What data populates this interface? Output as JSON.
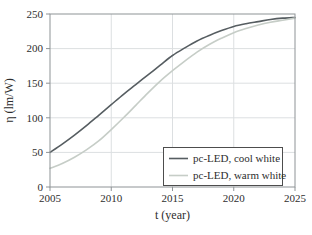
{
  "chart_data": {
    "type": "line",
    "title": "",
    "xlabel": "t (year)",
    "ylabel": "η (lm/W)",
    "xlim": [
      2005,
      2025
    ],
    "ylim": [
      0,
      250
    ],
    "x_ticks": [
      2005,
      2010,
      2015,
      2020,
      2025
    ],
    "y_ticks": [
      0,
      50,
      100,
      150,
      200,
      250
    ],
    "grid": true,
    "legend_position": "lower right",
    "x": [
      2005,
      2006,
      2007,
      2008,
      2009,
      2010,
      2011,
      2012,
      2013,
      2014,
      2015,
      2016,
      2017,
      2018,
      2019,
      2020,
      2021,
      2022,
      2023,
      2024,
      2025
    ],
    "series": [
      {
        "name": "pc-LED, cool white",
        "color": "#565d61",
        "values": [
          50,
          62,
          75,
          89,
          104,
          119,
          134,
          148,
          162,
          176,
          190,
          201,
          211,
          219,
          226,
          232,
          236,
          239,
          242,
          244,
          245
        ]
      },
      {
        "name": "pc-LED, warm white",
        "color": "#c6cdc7",
        "values": [
          27,
          34,
          43,
          54,
          67,
          83,
          100,
          118,
          136,
          153,
          168,
          182,
          195,
          206,
          215,
          223,
          229,
          234,
          238,
          241,
          244
        ]
      }
    ],
    "grid_color": "#dcdfe1",
    "frame_color": "#8e9396",
    "text_color": "#2e2e2e"
  }
}
